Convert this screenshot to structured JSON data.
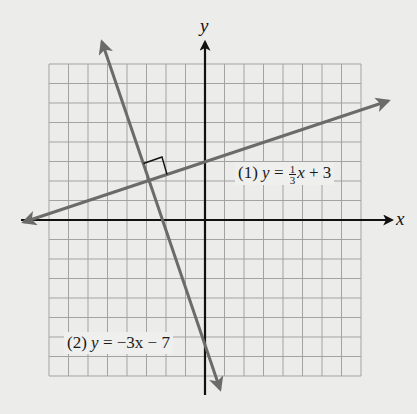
{
  "chart_data": {
    "type": "line",
    "title": "",
    "xlabel": "x",
    "ylabel": "y",
    "xlim": [
      -8,
      8
    ],
    "ylim": [
      -8,
      8
    ],
    "grid": true,
    "grid_step": 1,
    "legend_position": "inline labels",
    "series": [
      {
        "name": "(1) y = 1/3 x + 3",
        "slope": 0.3333,
        "intercept": 3,
        "points": [
          [
            -9.4,
            -0.13
          ],
          [
            0,
            3
          ],
          [
            9.5,
            6.17
          ]
        ]
      },
      {
        "name": "(2) y = -3x - 7",
        "slope": -3,
        "intercept": -7,
        "points": [
          [
            -5.4,
            9.2
          ],
          [
            -3,
            2
          ],
          [
            0,
            -7
          ],
          [
            0.6,
            -8.8
          ]
        ]
      }
    ],
    "annotations": [
      {
        "type": "right-angle-marker",
        "at": [
          -3,
          2
        ],
        "text": "perpendicular"
      },
      {
        "type": "intersection",
        "at": [
          -3,
          2
        ]
      }
    ]
  },
  "labels": {
    "x_axis": "x",
    "y_axis": "y",
    "eq1": {
      "number": "(1)",
      "lhs": "y",
      "eq": "=",
      "num": "1",
      "den": "3",
      "var": "x",
      "rest": "+ 3"
    },
    "eq2": {
      "number": "(2)",
      "lhs": "y",
      "eq": "=",
      "rhs": "−3x",
      "rest": "− 7"
    }
  },
  "colors": {
    "background": "#ececea",
    "grid": "#a3a3a3",
    "axes": "#111111",
    "lines": "#6b6b6b"
  }
}
